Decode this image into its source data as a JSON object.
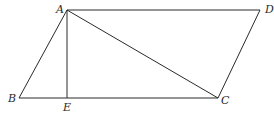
{
  "diagram": {
    "type": "geometry-figure",
    "points": {
      "A": "A",
      "B": "B",
      "C": "C",
      "D": "D",
      "E": "E"
    },
    "segments": [
      {
        "name": "AD",
        "from": "A",
        "to": "D"
      },
      {
        "name": "AB",
        "from": "A",
        "to": "B"
      },
      {
        "name": "BC",
        "from": "B",
        "to": "C"
      },
      {
        "name": "CD",
        "from": "C",
        "to": "D"
      },
      {
        "name": "AC",
        "from": "A",
        "to": "C"
      },
      {
        "name": "AE",
        "from": "A",
        "to": "E"
      }
    ],
    "color": "#2a2a2a"
  }
}
